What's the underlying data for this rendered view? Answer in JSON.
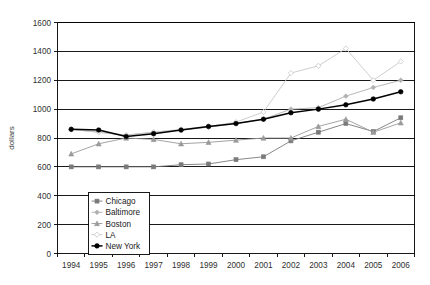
{
  "chart_data": {
    "type": "line",
    "title": "",
    "xlabel": "",
    "ylabel": "dollars",
    "x": [
      1994,
      1995,
      1996,
      1997,
      1998,
      1999,
      2000,
      2001,
      2002,
      2003,
      2004,
      2005,
      2006
    ],
    "xtick_labels": [
      "1994",
      "1995",
      "1996",
      "1997",
      "1998",
      "1999",
      "2000",
      "2001",
      "2002",
      "2003",
      "2004",
      "2005",
      "2006"
    ],
    "ytick_labels": [
      "0",
      "200",
      "400",
      "600",
      "800",
      "1000",
      "1200",
      "1400",
      "1600"
    ],
    "yticks": [
      0,
      200,
      400,
      600,
      800,
      1000,
      1200,
      1400,
      1600
    ],
    "ylim": [
      0,
      1600
    ],
    "grid": "horizontal",
    "legend_position": "bottom-left-inside",
    "series": [
      {
        "name": "Chicago",
        "color": "#7a7a7a",
        "marker": "square",
        "values": [
          600,
          600,
          600,
          600,
          615,
          620,
          650,
          670,
          780,
          840,
          900,
          845,
          940
        ]
      },
      {
        "name": "Baltimore",
        "color": "#b0b0b0",
        "marker": "diamond",
        "values": [
          860,
          840,
          820,
          840,
          855,
          875,
          900,
          930,
          1000,
          1010,
          1090,
          1150,
          1200
        ]
      },
      {
        "name": "Boston",
        "color": "#9a9a9a",
        "marker": "triangle",
        "values": [
          690,
          760,
          800,
          790,
          760,
          770,
          785,
          800,
          800,
          880,
          930,
          840,
          905
        ]
      },
      {
        "name": "LA",
        "color": "#c8c8c8",
        "marker": "diamond-open",
        "values": [
          860,
          840,
          820,
          840,
          860,
          880,
          910,
          980,
          1250,
          1300,
          1420,
          1200,
          1330
        ]
      },
      {
        "name": "New York",
        "color": "#000000",
        "marker": "circle",
        "values": [
          860,
          855,
          810,
          830,
          855,
          880,
          900,
          930,
          975,
          1000,
          1030,
          1070,
          1120
        ]
      }
    ]
  }
}
